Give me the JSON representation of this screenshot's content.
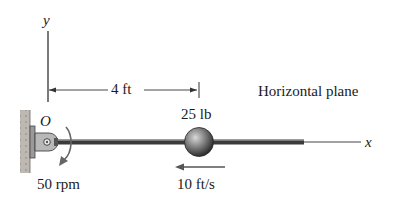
{
  "diagram": {
    "axes": {
      "y_label": "y",
      "x_label": "x",
      "origin_label": "O"
    },
    "dimension": {
      "label": "4 ft"
    },
    "mass": {
      "label": "25 lb"
    },
    "velocity": {
      "label": "10 ft/s",
      "direction": "left"
    },
    "angular_speed": {
      "label": "50 rpm",
      "direction": "clockwise-down"
    },
    "plane_note": "Horizontal plane",
    "colors": {
      "rod": "#3a3a3a",
      "wall": "#b9b4ae",
      "ball": "#6e6e6e",
      "arrow": "#5a5a5a"
    }
  }
}
